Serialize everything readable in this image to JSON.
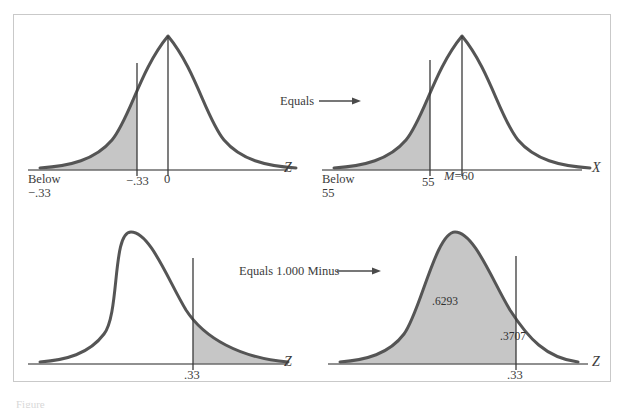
{
  "figure": {
    "background_color": "#ffffff",
    "frame_color": "#c9c9c9",
    "curve_color": "#555555",
    "shade_color": "#c6c6c6",
    "axis_color": "#6b6b6b",
    "caption_partial": "Figure"
  },
  "connectors": [
    {
      "label": "Equals",
      "name": "connector-equals"
    },
    {
      "label": "Equals 1.000 Minus",
      "name": "connector-equals-one-minus"
    }
  ],
  "panels": [
    {
      "id": "panel-top-left",
      "axis_label": "Z",
      "below_label": "Below\n−.33",
      "ticks": [
        {
          "label": "−.33",
          "value": -0.33
        },
        {
          "label": "0",
          "value": 0
        }
      ],
      "shaded_region": "left-tail-below-minus-.33",
      "probability_labels": []
    },
    {
      "id": "panel-top-right",
      "axis_label": "X",
      "below_label": "Below\n55",
      "ticks": [
        {
          "label": "55",
          "value": 55
        },
        {
          "label": "M=60",
          "value": 60
        }
      ],
      "shaded_region": "left-tail-below-55",
      "probability_labels": []
    },
    {
      "id": "panel-bottom-left",
      "axis_label": "Z",
      "below_label": "",
      "ticks": [
        {
          "label": ".33",
          "value": 0.33
        }
      ],
      "shaded_region": "right-tail-above-.33",
      "probability_labels": []
    },
    {
      "id": "panel-bottom-right",
      "axis_label": "Z",
      "below_label": "",
      "ticks": [
        {
          "label": ".33",
          "value": 0.33
        }
      ],
      "shaded_region": "left-area-below-.33",
      "probability_labels": [
        {
          "label": ".6293",
          "name": "probability-shaded-left"
        },
        {
          "label": ".3707",
          "name": "probability-unshaded-right"
        }
      ]
    }
  ],
  "chart_data": {
    "type": "line",
    "title": "",
    "xlabel": "",
    "ylabel": "",
    "grid": false,
    "legend": "none",
    "curves": [
      {
        "name": "panel-top-left",
        "distribution": "standard normal",
        "mean": 0,
        "sd": 1,
        "axis_label": "Z",
        "cut_point": -0.33,
        "cut_point_label": "−.33",
        "mean_label": "0",
        "shaded": "below",
        "shaded_proportion": 0.3707,
        "annotation": "Below −.33"
      },
      {
        "name": "panel-top-right",
        "distribution": "normal raw score",
        "mean": 60,
        "mean_label": "M=60",
        "axis_label": "X",
        "cut_point": 55,
        "cut_point_label": "55",
        "shaded": "below",
        "shaded_proportion": 0.3707,
        "annotation": "Below 55"
      },
      {
        "name": "panel-bottom-left",
        "distribution": "standard normal",
        "mean": 0,
        "sd": 1,
        "axis_label": "Z",
        "cut_point": 0.33,
        "cut_point_label": ".33",
        "shaded": "above",
        "shaded_proportion": 0.3707,
        "annotation": ""
      },
      {
        "name": "panel-bottom-right",
        "distribution": "standard normal",
        "mean": 0,
        "sd": 1,
        "axis_label": "Z",
        "cut_point": 0.33,
        "cut_point_label": ".33",
        "shaded": "below",
        "shaded_proportion": 0.6293,
        "upper_proportion": 0.3707,
        "labels_in_plot": [
          ".6293",
          ".3707"
        ]
      }
    ],
    "relations": [
      "Equals",
      "Equals 1.000 Minus"
    ]
  }
}
